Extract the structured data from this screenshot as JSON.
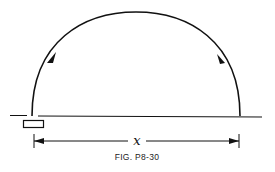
{
  "figure": {
    "caption": "FIG. P8-30",
    "dimension_label": "x",
    "elements": [
      "ground-line",
      "launcher",
      "trajectory-arc",
      "direction-arrows",
      "range-dimension"
    ],
    "colors": {
      "ink": "#111111",
      "background": "#ffffff"
    }
  }
}
